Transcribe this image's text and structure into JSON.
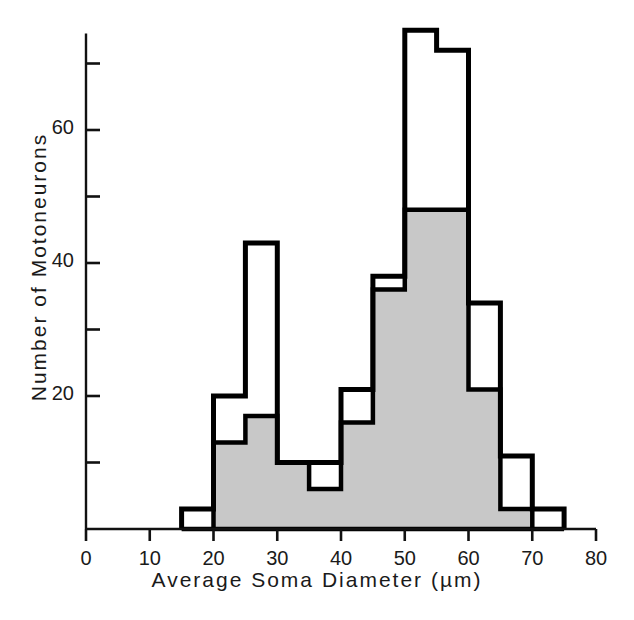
{
  "chart_data": {
    "type": "bar",
    "title": "",
    "xlabel": "Average Soma Diameter  (µm)",
    "ylabel": "Number  of  Motoneurons",
    "xlim": [
      0,
      80
    ],
    "ylim": [
      0,
      77
    ],
    "xticks": [
      0,
      10,
      20,
      30,
      40,
      50,
      60,
      70,
      80
    ],
    "xtick_labels": [
      "0",
      "10",
      "20",
      "30",
      "40",
      "50",
      "60",
      "70",
      "80"
    ],
    "yticks": [
      0,
      10,
      20,
      30,
      40,
      50,
      60,
      70
    ],
    "ytick_labels": [
      "",
      "",
      "20",
      "",
      "40",
      "",
      "60",
      ""
    ],
    "ytick_labeled": [
      20,
      40,
      60
    ],
    "grid": false,
    "legend": false,
    "bin_width": 5,
    "bin_starts": [
      15,
      20,
      25,
      30,
      35,
      40,
      45,
      50,
      55,
      60,
      65,
      70
    ],
    "categories": [
      "15-20",
      "20-25",
      "25-30",
      "30-35",
      "35-40",
      "40-45",
      "45-50",
      "50-55",
      "55-60",
      "60-65",
      "65-70",
      "70-75"
    ],
    "series": [
      {
        "name": "total (outline)",
        "style": "outline",
        "color": "#000000",
        "values": [
          3,
          20,
          43,
          10,
          10,
          21,
          38,
          75,
          72,
          34,
          11,
          3
        ]
      },
      {
        "name": "subset (shaded)",
        "style": "filled",
        "color": "#c8c8c8",
        "values": [
          0,
          13,
          17,
          10,
          6,
          16,
          36,
          48,
          48,
          21,
          3,
          0
        ]
      }
    ]
  },
  "axes": {
    "x_axis_name": "x-axis",
    "y_axis_name": "y-axis"
  }
}
